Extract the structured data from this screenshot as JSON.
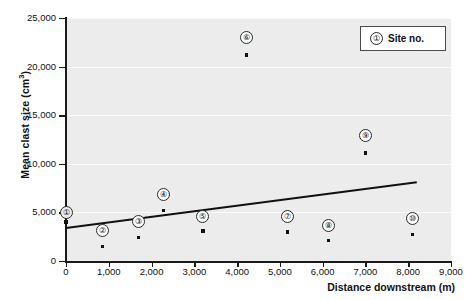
{
  "chart_data": {
    "type": "scatter",
    "title": "",
    "xlabel": "Distance downstream (m)",
    "ylabel": "Mean clast size (cm³)",
    "ylabel_base": "Mean clast size (cm",
    "ylabel_sup": "3",
    "ylabel_close": ")",
    "xlim": [
      0,
      9000
    ],
    "ylim": [
      0,
      25000
    ],
    "xticks": [
      0,
      1000,
      2000,
      3000,
      4000,
      5000,
      6000,
      7000,
      8000,
      9000
    ],
    "xtick_labels": [
      "0",
      "1,000",
      "2,000",
      "3,000",
      "4,000",
      "5,000",
      "6,000",
      "7,000",
      "8,000",
      "9,000"
    ],
    "yticks": [
      0,
      5000,
      10000,
      15000,
      20000,
      25000
    ],
    "ytick_labels": [
      "0",
      "5,000",
      "10,000",
      "15,000",
      "20,000",
      "25,000"
    ],
    "grid": "horizontal",
    "points": [
      {
        "site": "1",
        "label": "①",
        "x": 0,
        "y": 4000,
        "tag_y": 5000
      },
      {
        "site": "2",
        "label": "②",
        "x": 850,
        "y": 1500,
        "tag_y": 3100
      },
      {
        "site": "3",
        "label": "③",
        "x": 1700,
        "y": 2400,
        "tag_y": 4100
      },
      {
        "site": "4",
        "label": "④",
        "x": 2280,
        "y": 5200,
        "tag_y": 6800
      },
      {
        "site": "5",
        "label": "⑤",
        "x": 3200,
        "y": 3100,
        "tag_y": 4600
      },
      {
        "site": "6",
        "label": "⑥",
        "x": 4220,
        "y": 21200,
        "tag_y": 23000
      },
      {
        "site": "7",
        "label": "⑦",
        "x": 5180,
        "y": 3000,
        "tag_y": 4600
      },
      {
        "site": "8",
        "label": "⑧",
        "x": 6130,
        "y": 2100,
        "tag_y": 3700
      },
      {
        "site": "9",
        "label": "⑨",
        "x": 7000,
        "y": 11100,
        "tag_y": 12900
      },
      {
        "site": "10",
        "label": "⑩",
        "x": 8100,
        "y": 2700,
        "tag_y": 4400
      }
    ],
    "trend_line": {
      "x0": 0,
      "y0": 3400,
      "x1": 8200,
      "y1": 8100
    }
  },
  "legend": {
    "symbol": "①",
    "label": "Site no."
  }
}
